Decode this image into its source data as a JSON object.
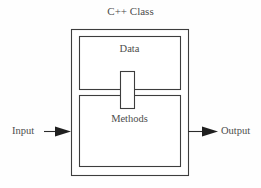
{
  "diagram": {
    "title": "C++ Class",
    "type": "block-diagram",
    "canvas": {
      "width": 261,
      "height": 188,
      "background": "#fefefe"
    },
    "colors": {
      "stroke": "#3d3d3d",
      "text": "#4d4d4d",
      "fill": "#ffffff",
      "background": "#fefefe"
    },
    "outer_box": {
      "name": "class-boundary",
      "x": 71,
      "y": 29,
      "width": 117,
      "height": 146
    },
    "blocks": [
      {
        "id": "data",
        "label": "Data",
        "x": 79,
        "y": 36,
        "width": 101,
        "height": 53
      },
      {
        "id": "methods",
        "label": "Methods",
        "x": 79,
        "y": 95,
        "width": 101,
        "height": 71
      }
    ],
    "connector": {
      "id": "data-methods-link",
      "label": "",
      "x": 120,
      "y": 71,
      "width": 14,
      "height": 37
    },
    "arrows": [
      {
        "id": "input",
        "label": "Input",
        "direction": "right",
        "from_x": 44,
        "to_x": 71,
        "y": 131
      },
      {
        "id": "output",
        "label": "Output",
        "direction": "right",
        "from_x": 188,
        "to_x": 218,
        "y": 131
      }
    ]
  }
}
